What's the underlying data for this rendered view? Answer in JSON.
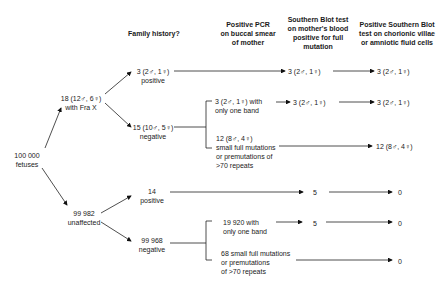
{
  "headers": {
    "family_history": "Family history?",
    "pcr": [
      "Positive PCR",
      "on buccal smear",
      "of mother"
    ],
    "southern_blot_mother": [
      "Southern Blot test",
      "on mother's blood",
      "positive for full",
      "mutation"
    ],
    "southern_blot_fetal": [
      "Positive Southern Blot",
      "test on chorionic villae",
      "or amniotic fluid cells"
    ]
  },
  "root": [
    "100 000",
    "fetuses"
  ],
  "affected": [
    "18 (12♂, 6♀)",
    "with Fra X"
  ],
  "unaffected": [
    "99 982",
    "unaffected"
  ],
  "aff_pos": [
    "3 (2♂, 1♀)",
    "positive"
  ],
  "aff_neg": [
    "15 (10♂, 5♀)",
    "negative"
  ],
  "unaff_pos": [
    "14",
    "positive"
  ],
  "unaff_neg": [
    "99 968",
    "negative"
  ],
  "aff_pos_blot": "3 (2♂, 1♀)",
  "aff_pos_fetal": "3 (2♂, 1♀)",
  "aff_neg_one_band": [
    "3 (2♂, 1♀) with",
    "only one band"
  ],
  "aff_neg_one_band_blot": "3 (2♂, 1♀)",
  "aff_neg_one_band_fetal": "3 (2♂, 1♀)",
  "aff_neg_small": [
    "12 (8♂, 4♀)",
    "small full mutations",
    "or premutations of",
    ">70 repeats"
  ],
  "aff_neg_small_fetal": "12 (8♂, 4♀)",
  "unaff_pos_blot": "5",
  "unaff_pos_fetal": "0",
  "unaff_neg_one_band": [
    "19 920 with",
    "only one band"
  ],
  "unaff_neg_one_band_blot": "5",
  "unaff_neg_one_band_fetal": "0",
  "unaff_neg_small": [
    "68 small full mutations",
    "or premutations",
    "of >70 repeats"
  ],
  "unaff_neg_small_fetal": "0"
}
